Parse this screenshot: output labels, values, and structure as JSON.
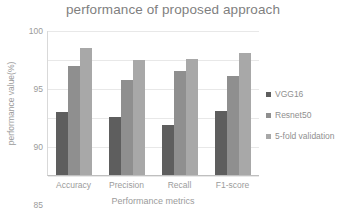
{
  "chart_data": {
    "type": "bar",
    "title": "performance of proposed approach",
    "xlabel": "Performance metrics",
    "ylabel": "performance value(%)",
    "categories": [
      "Accuracy",
      "Precision",
      "Recall",
      "F1-score"
    ],
    "series": [
      {
        "name": "VGG16",
        "color": "#5e5e5e",
        "values": [
          86.0,
          85.0,
          83.7,
          86.2
        ]
      },
      {
        "name": "Resnet50",
        "color": "#8f8f8f",
        "values": [
          94.0,
          91.5,
          93.1,
          92.2
        ]
      },
      {
        "name": "5-fold validation",
        "color": "#a8a8a8",
        "values": [
          97.0,
          95.0,
          95.1,
          96.2
        ]
      }
    ],
    "ylim": [
      75,
      100
    ],
    "yticks": [
      100,
      95,
      90,
      85,
      80,
      75
    ],
    "ytick_labels": [
      "100",
      "95",
      "90",
      "85",
      "80",
      "75"
    ],
    "grid": true,
    "legend_position": "right"
  }
}
